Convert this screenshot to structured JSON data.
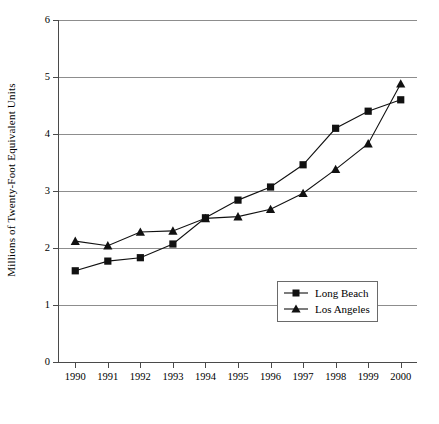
{
  "chart_data": {
    "type": "line",
    "title": "",
    "xlabel": "",
    "ylabel": "Millions of Twenty-Foot Equivalent Units",
    "categories": [
      "1990",
      "1991",
      "1992",
      "1993",
      "1994",
      "1995",
      "1996",
      "1997",
      "1998",
      "1999",
      "2000"
    ],
    "x": [
      1990,
      1991,
      1992,
      1993,
      1994,
      1995,
      1996,
      1997,
      1998,
      1999,
      2000
    ],
    "xlim": [
      1989.5,
      2000.5
    ],
    "ylim": [
      0,
      6
    ],
    "yticks": [
      0,
      1,
      2,
      3,
      4,
      5,
      6
    ],
    "yticklabels": [
      "0",
      "1",
      "2",
      "3",
      "4",
      "5",
      "6"
    ],
    "grid": "horizontal",
    "legend_position": "lower right inside",
    "series": [
      {
        "name": "Long Beach",
        "marker": "square",
        "values": [
          1.6,
          1.77,
          1.83,
          2.07,
          2.53,
          2.84,
          3.07,
          3.46,
          4.1,
          4.4,
          4.6
        ]
      },
      {
        "name": "Los Angeles",
        "marker": "triangle",
        "values": [
          2.12,
          2.04,
          2.28,
          2.3,
          2.52,
          2.55,
          2.68,
          2.96,
          3.38,
          3.83,
          4.88
        ]
      }
    ]
  },
  "axes": {
    "y_axis_title": "Millions of Twenty-Foot Equivalent Units"
  },
  "legend": {
    "items": [
      {
        "label": "Long Beach",
        "marker": "square-marker-icon"
      },
      {
        "label": "Los Angeles",
        "marker": "triangle-marker-icon"
      }
    ]
  }
}
